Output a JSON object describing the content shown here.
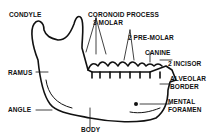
{
  "labels": {
    "condyle": "CONDYLE",
    "coronoid": "CORONOID PROCESS",
    "molar": "3 MOLAR",
    "premolar": "2 PRE-MOLAR",
    "canine": "CANINE",
    "incisor": "2 INCISOR",
    "alveolar1": "ALVEOLAR",
    "alveolar2": "BORDER",
    "ramus": "RAMUS",
    "angle": "ANGLE",
    "mental1": "MENTAL",
    "mental2": "FORAMEN",
    "body": "BODY"
  },
  "colors": {
    "ink": "#111111",
    "background": "#ffffff"
  }
}
